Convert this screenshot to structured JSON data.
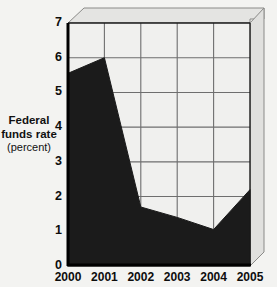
{
  "chart_data": {
    "type": "area",
    "title": "",
    "subtitle": "",
    "xlabel": "",
    "ylabel": "Federal funds rate (percent)",
    "ylabel_lines": [
      "Federal",
      "funds rate",
      "(percent)"
    ],
    "categories": [
      "2000",
      "2001",
      "2002",
      "2003",
      "2004",
      "2005"
    ],
    "x": [
      2000,
      2001,
      2002,
      2003,
      2004,
      2005
    ],
    "values": [
      5.55,
      6.0,
      1.7,
      1.4,
      1.05,
      2.2
    ],
    "series": [
      {
        "name": "Federal funds rate",
        "values": [
          5.55,
          6.0,
          1.7,
          1.4,
          1.05,
          2.2
        ]
      }
    ],
    "ylim": [
      0,
      7
    ],
    "xlim": [
      "2000",
      "2005"
    ],
    "yticks": [
      0,
      1,
      2,
      3,
      4,
      5,
      6,
      7
    ],
    "ytick_labels": [
      "0",
      "1",
      "2",
      "3",
      "4",
      "5",
      "6",
      "7"
    ],
    "xtick_labels": [
      "2000",
      "2001",
      "2002",
      "2003",
      "2004",
      "2005"
    ],
    "grid": true,
    "grid_axis": "both",
    "legend": false,
    "legend_position": "none",
    "fill_color": "#1b1b1b",
    "grid_color": "#6e6e6e",
    "axis_color": "#0a0a0a",
    "plot_background": "#f0f0ee",
    "page_background": "#f3f3f1",
    "style": "3d-box-frame"
  },
  "yticks": {
    "t0": "0",
    "t1": "1",
    "t2": "2",
    "t3": "3",
    "t4": "4",
    "t5": "5",
    "t6": "6",
    "t7": "7"
  },
  "xticks": {
    "t2000": "2000",
    "t2001": "2001",
    "t2002": "2002",
    "t2003": "2003",
    "t2004": "2004",
    "t2005": "2005"
  },
  "ylabel": {
    "line1": "Federal",
    "line2": "funds rate",
    "line3": "(percent)"
  }
}
